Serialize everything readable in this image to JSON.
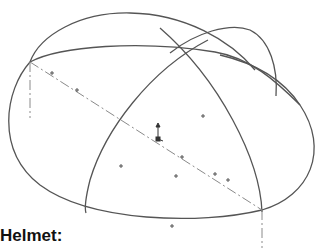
{
  "label": "Helmet:",
  "colors": {
    "stroke": "#555555",
    "axis": "#8a8a8a",
    "background": "#ffffff",
    "text": "#111111"
  },
  "drawing": {
    "description": "Isometric wireframe of a helmet shell: elliptical rim, two crossing meridian arcs, a dash-dot centre axis and scattered sketch point markers",
    "point_markers": [
      [
        52,
        73
      ],
      [
        77,
        90
      ],
      [
        203,
        116
      ],
      [
        182,
        157
      ],
      [
        176,
        176
      ],
      [
        121,
        166
      ],
      [
        215,
        174
      ],
      [
        228,
        180
      ],
      [
        172,
        226
      ]
    ],
    "origin_marker": [
      159,
      139
    ]
  }
}
